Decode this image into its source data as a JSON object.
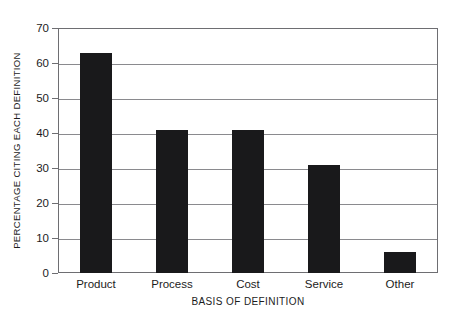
{
  "chart_data": {
    "type": "bar",
    "title": "",
    "subtitle": "",
    "xlabel": "BASIS OF DEFINITION",
    "ylabel": "PERCENTAGE CITING EACH DEFINITION",
    "categories": [
      "Product",
      "Process",
      "Cost",
      "Service",
      "Other"
    ],
    "values": [
      63,
      41,
      41,
      31,
      6
    ],
    "series": [
      {
        "name": "Percentage citing each definition",
        "values": [
          63,
          41,
          41,
          31,
          6
        ]
      }
    ],
    "ylim": [
      0,
      70
    ],
    "ytick_labels": [
      "0",
      "10",
      "20",
      "30",
      "40",
      "50",
      "60",
      "70"
    ],
    "ytick_values": [
      0,
      10,
      20,
      30,
      40,
      50,
      60,
      70
    ],
    "ytick_interval": 10,
    "grid": "horizontal",
    "legend": "none",
    "bar_color": "#19191b",
    "grid_color": "#8a8a8e",
    "frame_color": "#6e6e72",
    "background_color": "#ffffff",
    "text_color": "#1c1c1c",
    "annotations": []
  }
}
